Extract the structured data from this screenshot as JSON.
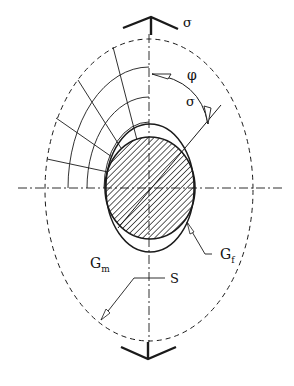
{
  "figure": {
    "labels": {
      "sigma_top": "σ",
      "sigma_bottom": "σ",
      "phi": "φ",
      "G_m_base": "G",
      "G_m_sub": "m",
      "G_f_base": "G",
      "G_f_sub": "f",
      "S": "S"
    },
    "colors": {
      "line": "#1a1a1a",
      "background": "#ffffff"
    }
  }
}
